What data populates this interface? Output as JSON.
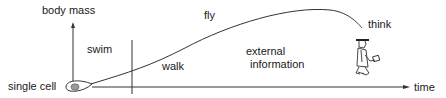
{
  "diagram": {
    "y_axis_label": "body mass",
    "x_axis_label": "time",
    "origin_label": "single  cell",
    "phases": {
      "swim": "swim",
      "walk": "walk",
      "fly": "fly",
      "think": "think",
      "external_line1": "external",
      "external_line2": "information"
    },
    "colors": {
      "line": "#333333",
      "cell_nucleus": "#9a9a9a",
      "text": "#1a1a1a"
    },
    "icons": [
      "cell-icon",
      "walking-scholar-icon",
      "arrow-right-icon",
      "arrow-up-icon"
    ]
  }
}
